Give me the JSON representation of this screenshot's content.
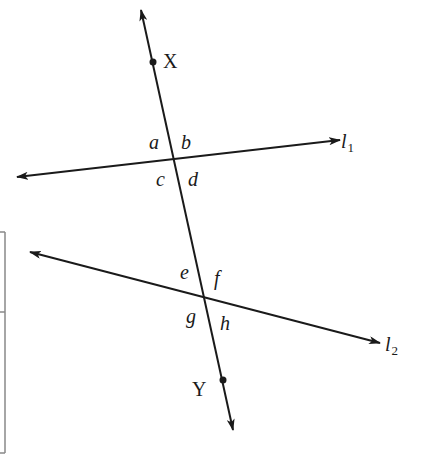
{
  "diagram": {
    "colors": {
      "line": "#1a1a1a",
      "frame": "#888888",
      "background": "#ffffff"
    },
    "transversal": {
      "name": "XY",
      "start": [
        141,
        10
      ],
      "end": [
        233,
        430
      ],
      "points": [
        {
          "label": "X",
          "at": [
            153,
            62
          ],
          "label_pos": [
            163,
            68
          ]
        },
        {
          "label": "Y",
          "at": [
            223,
            380
          ],
          "label_pos": [
            192,
            396
          ]
        }
      ]
    },
    "lines": [
      {
        "name": "l1",
        "label_main": "l",
        "label_sub": "1",
        "start": [
          17,
          177
        ],
        "end": [
          340,
          140
        ],
        "label_pos": [
          341,
          148
        ],
        "intersection": [
          175,
          157
        ]
      },
      {
        "name": "l2",
        "label_main": "l",
        "label_sub": "2",
        "start": [
          30,
          252
        ],
        "end": [
          380,
          343
        ],
        "label_pos": [
          385,
          351
        ],
        "intersection": [
          205,
          300
        ]
      }
    ],
    "angles": [
      {
        "label": "a",
        "pos": [
          149,
          149
        ]
      },
      {
        "label": "b",
        "pos": [
          181,
          149
        ]
      },
      {
        "label": "c",
        "pos": [
          156,
          186
        ]
      },
      {
        "label": "d",
        "pos": [
          188,
          186
        ]
      },
      {
        "label": "e",
        "pos": [
          180,
          279
        ]
      },
      {
        "label": "f",
        "pos": [
          214,
          285
        ]
      },
      {
        "label": "g",
        "pos": [
          186,
          323
        ]
      },
      {
        "label": "h",
        "pos": [
          220,
          330
        ]
      }
    ],
    "side_frame": {
      "top": 232,
      "bottom": 453,
      "right_x": 5,
      "divider_y": 312
    }
  }
}
